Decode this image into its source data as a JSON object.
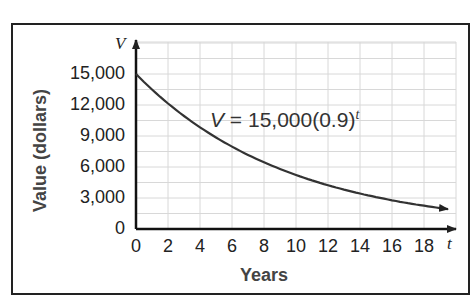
{
  "chart_data": {
    "type": "line",
    "title": "",
    "xlabel": "Years",
    "ylabel": "Value (dollars)",
    "x_axis_var": "t",
    "y_axis_var": "V",
    "xlim": [
      0,
      20
    ],
    "ylim": [
      0,
      16500
    ],
    "x_ticks": [
      "0",
      "2",
      "4",
      "6",
      "8",
      "10",
      "12",
      "14",
      "16",
      "18"
    ],
    "y_ticks": [
      "0",
      "3,000",
      "6,000",
      "9,000",
      "12,000",
      "15,000"
    ],
    "grid": true,
    "annotation": {
      "lhs": "V",
      "equals": "=",
      "rhs": "15,000(0.9)",
      "exponent": "t"
    },
    "series": [
      {
        "name": "V = 15,000(0.9)^t",
        "x": [
          0,
          2,
          4,
          6,
          8,
          10,
          12,
          14,
          16,
          18,
          19.5
        ],
        "values": [
          15000,
          12150,
          9842,
          7972,
          6457,
          5230,
          4236,
          3432,
          2780,
          2252,
          1920
        ]
      }
    ]
  }
}
